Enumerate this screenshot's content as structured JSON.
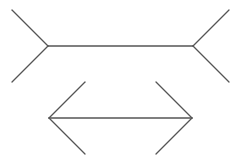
{
  "diagram": {
    "title": "",
    "type": "muller-lyer-illusion",
    "stroke_color": "#555555",
    "background_color": "#ffffff",
    "figures": [
      {
        "name": "outward-fins-figure",
        "fin_direction": "outward"
      },
      {
        "name": "inward-arrowheads-figure",
        "fin_direction": "inward"
      }
    ]
  }
}
